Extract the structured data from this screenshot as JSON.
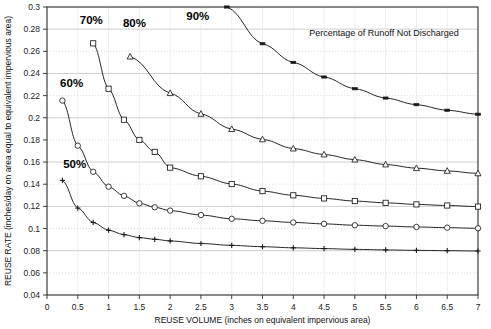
{
  "chart_data": {
    "type": "line",
    "title": "",
    "annotation": "Percentage of Runoff Not Discharged",
    "xlabel": "REUSE VOLUME (inches on equivalent impervious area)",
    "ylabel": "REUSE RATE (inches/day on area equal to equivalent impervious area)",
    "xlim": [
      0,
      7
    ],
    "ylim": [
      0.04,
      0.3
    ],
    "xticks": [
      "0",
      "0.5",
      "1",
      "1.5",
      "2",
      "2.5",
      "3",
      "3.5",
      "4",
      "4.5",
      "5",
      "5.5",
      "6",
      "6.5",
      "7"
    ],
    "xtick_values": [
      0,
      0.5,
      1,
      1.5,
      2,
      2.5,
      3,
      3.5,
      4,
      4.5,
      5,
      5.5,
      6,
      6.5,
      7
    ],
    "yticks": [
      "0.04",
      "0.06",
      "0.08",
      "0.1",
      "0.12",
      "0.14",
      "0.16",
      "0.18",
      "0.2",
      "0.22",
      "0.24",
      "0.26",
      "0.28",
      "0.3"
    ],
    "ytick_values": [
      0.04,
      0.06,
      0.08,
      0.1,
      0.12,
      0.14,
      0.16,
      0.18,
      0.2,
      0.22,
      0.24,
      0.26,
      0.28,
      0.3
    ],
    "grid": true,
    "legend_position": "inline-labels",
    "series": [
      {
        "name": "50%",
        "marker": "plus",
        "label_x": 0.45,
        "label_y": 0.155,
        "x": [
          0.25,
          0.5,
          0.75,
          1.0,
          1.25,
          1.5,
          1.75,
          2.0,
          2.5,
          3.0,
          3.5,
          4.0,
          4.5,
          5.0,
          5.5,
          6.0,
          6.5,
          7.0
        ],
        "y": [
          0.1435,
          0.1185,
          0.1055,
          0.0985,
          0.0945,
          0.0918,
          0.0903,
          0.0888,
          0.0865,
          0.0848,
          0.0836,
          0.0826,
          0.0819,
          0.0812,
          0.0807,
          0.0803,
          0.08,
          0.0797
        ]
      },
      {
        "name": "60%",
        "marker": "circle",
        "label_x": 0.4,
        "label_y": 0.228,
        "x": [
          0.25,
          0.5,
          0.75,
          1.0,
          1.25,
          1.5,
          1.75,
          2.0,
          2.5,
          3.0,
          3.5,
          4.0,
          4.5,
          5.0,
          5.5,
          6.0,
          6.5,
          7.0
        ],
        "y": [
          0.2155,
          0.1748,
          0.1512,
          0.1378,
          0.1295,
          0.1228,
          0.1192,
          0.1162,
          0.1122,
          0.1088,
          0.107,
          0.1055,
          0.1042,
          0.103,
          0.1022,
          0.1014,
          0.1008,
          0.1002
        ]
      },
      {
        "name": "70%",
        "marker": "square",
        "label_x": 0.72,
        "label_y": 0.285,
        "x": [
          0.75,
          1.0,
          1.25,
          1.5,
          1.75,
          2.0,
          2.5,
          3.0,
          3.5,
          4.0,
          4.5,
          5.0,
          5.5,
          6.0,
          6.5,
          7.0
        ],
        "y": [
          0.2672,
          0.2262,
          0.1982,
          0.18,
          0.1692,
          0.155,
          0.1472,
          0.1402,
          0.1338,
          0.13,
          0.1272,
          0.1248,
          0.1232,
          0.1218,
          0.1208,
          0.1198
        ]
      },
      {
        "name": "80%",
        "marker": "triangle",
        "label_x": 1.42,
        "label_y": 0.282,
        "x": [
          1.35,
          2.0,
          2.5,
          3.0,
          3.5,
          4.0,
          4.5,
          5.0,
          5.5,
          6.0,
          6.5,
          7.0
        ],
        "y": [
          0.2552,
          0.2222,
          0.2035,
          0.1898,
          0.1805,
          0.1722,
          0.1668,
          0.1622,
          0.1578,
          0.1545,
          0.152,
          0.1498
        ]
      },
      {
        "name": "90%",
        "marker": "dash",
        "label_x": 2.45,
        "label_y": 0.288,
        "x": [
          2.92,
          3.5,
          4.0,
          4.5,
          5.0,
          5.5,
          6.0,
          6.5,
          7.0
        ],
        "y": [
          0.3,
          0.2668,
          0.25,
          0.2368,
          0.2262,
          0.2178,
          0.2118,
          0.2068,
          0.2032
        ]
      }
    ]
  }
}
